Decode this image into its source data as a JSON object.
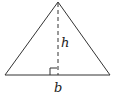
{
  "diagram": {
    "type": "triangle-area",
    "shape": "isosceles triangle",
    "labels": {
      "height": "h",
      "base": "b"
    },
    "annotations": [
      "right-angle marker at foot of altitude",
      "dashed altitude from apex to base"
    ],
    "colors": {
      "stroke": "#333333",
      "background": "#ffffff"
    }
  }
}
